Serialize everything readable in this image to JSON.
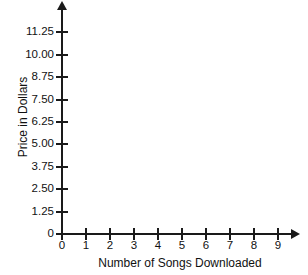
{
  "chart_data": {
    "type": "scatter",
    "title": "",
    "subtitle": "",
    "xlabel": "Number of Songs Downloaded",
    "ylabel": "Price in Dollars",
    "x": [],
    "values": [],
    "series": [],
    "annotations": [],
    "legend": [],
    "legend_position": "none",
    "grid": false,
    "xlim": [
      0,
      9
    ],
    "ylim": [
      0,
      11.25
    ],
    "x_tick_labels": [
      "0",
      "1",
      "2",
      "3",
      "4",
      "5",
      "6",
      "7",
      "8",
      "9"
    ],
    "x_tick_values": [
      0,
      1,
      2,
      3,
      4,
      5,
      6,
      7,
      8,
      9
    ],
    "y_tick_labels": [
      "0",
      "1.25",
      "2.50",
      "3.75",
      "5.00",
      "6.25",
      "7.50",
      "8.75",
      "10.00",
      "11.25"
    ],
    "y_tick_values": [
      0,
      1.25,
      2.5,
      3.75,
      5,
      6.25,
      7.5,
      8.75,
      10,
      11.25
    ],
    "x_tick_step": 1,
    "y_tick_step": 1.25,
    "note": "Empty coordinate grid with no plotted data points",
    "colors": {
      "axis": "#1a1a1a",
      "text": "#111111",
      "background": "#ffffff"
    }
  }
}
